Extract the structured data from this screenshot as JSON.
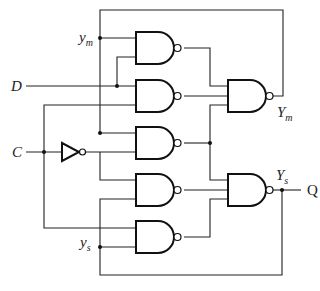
{
  "diagram": {
    "title": "",
    "type": "logic circuit - master-slave D flip-flop (NAND gates)",
    "inputs": {
      "D": {
        "label": "D"
      },
      "C": {
        "label": "C"
      }
    },
    "internal_labels": {
      "ym": {
        "main": "y",
        "sub": "m"
      },
      "ys": {
        "main": "y",
        "sub": "s"
      },
      "Ym": {
        "main": "Y",
        "sub": "m"
      },
      "Ys": {
        "main": "Y",
        "sub": "s"
      }
    },
    "output": {
      "label": "Q"
    },
    "gates": [
      {
        "id": "G1",
        "type": "NAND"
      },
      {
        "id": "G2",
        "type": "NAND"
      },
      {
        "id": "G3",
        "type": "NAND"
      },
      {
        "id": "G4",
        "type": "NAND"
      },
      {
        "id": "G5",
        "type": "NAND"
      },
      {
        "id": "G_Ym",
        "type": "NAND",
        "output_label": "Ym"
      },
      {
        "id": "G_Ys",
        "type": "NAND",
        "output_label": "Ys"
      },
      {
        "id": "INV",
        "type": "NOT",
        "input": "C"
      }
    ]
  }
}
